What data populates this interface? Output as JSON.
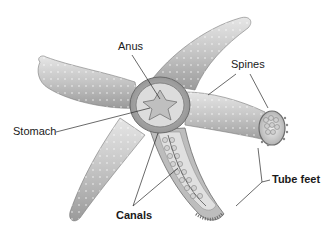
{
  "diagram": {
    "labels": {
      "anus": "Anus",
      "spines": "Spines",
      "stomach": "Stomach",
      "canals": "Canals",
      "tube_feet": "Tube feet"
    },
    "colors": {
      "background": "#ffffff",
      "body_light": "#d9d9d9",
      "body_mid": "#b5b5b5",
      "body_dark": "#8a8a8a",
      "leader_line": "#2a2a2a",
      "label_text": "#1a1a1a"
    }
  }
}
